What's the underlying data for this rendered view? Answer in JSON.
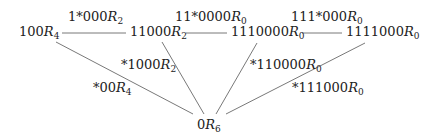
{
  "diagram": {
    "nodes": [
      {
        "id": "n100",
        "prefix": "100",
        "sub": "4"
      },
      {
        "id": "n11000",
        "prefix": "11000",
        "sub": "2"
      },
      {
        "id": "n1110000",
        "prefix": "1110000",
        "sub": "0"
      },
      {
        "id": "n1111000",
        "prefix": "1111000",
        "sub": "0"
      },
      {
        "id": "n0",
        "prefix": "0",
        "sub": "6"
      }
    ],
    "edges": [
      {
        "from": "n100",
        "to": "n11000",
        "prefix": "1*000",
        "sub": "2"
      },
      {
        "from": "n11000",
        "to": "n1110000",
        "prefix": "11*0000",
        "sub": "0"
      },
      {
        "from": "n1110000",
        "to": "n1111000",
        "prefix": "111*000",
        "sub": "0"
      },
      {
        "from": "n100",
        "to": "n0",
        "prefix": "*00",
        "sub": "4"
      },
      {
        "from": "n11000",
        "to": "n0",
        "prefix": "*1000",
        "sub": "2"
      },
      {
        "from": "n1110000",
        "to": "n0",
        "prefix": "*110000",
        "sub": "0"
      },
      {
        "from": "n1111000",
        "to": "n0",
        "prefix": "*111000",
        "sub": "0"
      }
    ],
    "symbol": "R",
    "line_color": "#555555"
  }
}
